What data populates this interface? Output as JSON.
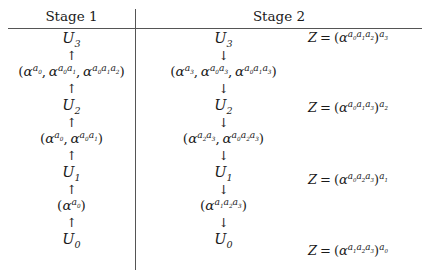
{
  "figure": {
    "type": "two-column-derivation-table",
    "columns": [
      {
        "id": "stage1",
        "header": "Stage 1",
        "arrow_direction": "up",
        "arrow_glyph": "↑"
      },
      {
        "id": "stage2",
        "header": "Stage 2",
        "arrow_direction": "down",
        "arrow_glyph": "↓"
      }
    ]
  },
  "stage1": {
    "header": "Stage 1",
    "arrow": "↑",
    "chain": [
      {
        "kind": "node",
        "text": "U₃",
        "base": "U",
        "subscript": "3"
      },
      {
        "kind": "arrow",
        "text": "↑"
      },
      {
        "kind": "tuple",
        "text": "(α^{a₀}, α^{a₀a₁}, α^{a₀a₁a₂})",
        "terms": [
          {
            "base": "α",
            "exponent": [
              "a0"
            ]
          },
          {
            "base": "α",
            "exponent": [
              "a0",
              "a1"
            ]
          },
          {
            "base": "α",
            "exponent": [
              "a0",
              "a1",
              "a2"
            ]
          }
        ]
      },
      {
        "kind": "arrow",
        "text": "↑"
      },
      {
        "kind": "node",
        "text": "U₂",
        "base": "U",
        "subscript": "2"
      },
      {
        "kind": "arrow",
        "text": "↑"
      },
      {
        "kind": "tuple",
        "text": "(α^{a₀}, α^{a₀a₁})",
        "terms": [
          {
            "base": "α",
            "exponent": [
              "a0"
            ]
          },
          {
            "base": "α",
            "exponent": [
              "a0",
              "a1"
            ]
          }
        ]
      },
      {
        "kind": "arrow",
        "text": "↑"
      },
      {
        "kind": "node",
        "text": "U₁",
        "base": "U",
        "subscript": "1"
      },
      {
        "kind": "arrow",
        "text": "↑"
      },
      {
        "kind": "tuple",
        "text": "(α^{a₀})",
        "terms": [
          {
            "base": "α",
            "exponent": [
              "a0"
            ]
          }
        ]
      },
      {
        "kind": "arrow",
        "text": "↑"
      },
      {
        "kind": "node",
        "text": "U₀",
        "base": "U",
        "subscript": "0"
      }
    ]
  },
  "stage2": {
    "header": "Stage 2",
    "arrow": "↓",
    "chain": [
      {
        "kind": "node",
        "text": "U₃",
        "base": "U",
        "subscript": "3"
      },
      {
        "kind": "arrow",
        "text": "↓"
      },
      {
        "kind": "tuple",
        "text": "(α^{a₃}, α^{a₀a₃}, α^{a₀a₁a₃})",
        "terms": [
          {
            "base": "α",
            "exponent": [
              "a3"
            ]
          },
          {
            "base": "α",
            "exponent": [
              "a0",
              "a3"
            ]
          },
          {
            "base": "α",
            "exponent": [
              "a0",
              "a1",
              "a3"
            ]
          }
        ]
      },
      {
        "kind": "arrow",
        "text": "↓"
      },
      {
        "kind": "node",
        "text": "U₂",
        "base": "U",
        "subscript": "2"
      },
      {
        "kind": "arrow",
        "text": "↓"
      },
      {
        "kind": "tuple",
        "text": "(α^{a₂a₃}, α^{a₀a₂a₃})",
        "terms": [
          {
            "base": "α",
            "exponent": [
              "a2",
              "a3"
            ]
          },
          {
            "base": "α",
            "exponent": [
              "a0",
              "a2",
              "a3"
            ]
          }
        ]
      },
      {
        "kind": "arrow",
        "text": "↓"
      },
      {
        "kind": "node",
        "text": "U₁",
        "base": "U",
        "subscript": "1"
      },
      {
        "kind": "arrow",
        "text": "↓"
      },
      {
        "kind": "tuple",
        "text": "(α^{a₁a₂a₃})",
        "terms": [
          {
            "base": "α",
            "exponent": [
              "a1",
              "a2",
              "a3"
            ]
          }
        ]
      },
      {
        "kind": "arrow",
        "text": "↓"
      },
      {
        "kind": "node",
        "text": "U₀",
        "base": "U",
        "subscript": "0"
      }
    ],
    "equations": [
      {
        "id": "z3",
        "text": "Z = (α^{a₀a₁a₂})^{a₃}",
        "lhs": "Z",
        "relation": "=",
        "inner_base": "α",
        "inner_exponent": [
          "a0",
          "a1",
          "a2"
        ],
        "outer_exponent": "a3",
        "aligned_with": "U3"
      },
      {
        "id": "z2",
        "text": "Z = (α^{a₀a₁a₃})^{a₂}",
        "lhs": "Z",
        "relation": "=",
        "inner_base": "α",
        "inner_exponent": [
          "a0",
          "a1",
          "a3"
        ],
        "outer_exponent": "a2",
        "aligned_with": "U2"
      },
      {
        "id": "z1",
        "text": "Z = (α^{a₀a₂a₃})^{a₁}",
        "lhs": "Z",
        "relation": "=",
        "inner_base": "α",
        "inner_exponent": [
          "a0",
          "a2",
          "a3"
        ],
        "outer_exponent": "a1",
        "aligned_with": "U1"
      },
      {
        "id": "z0",
        "text": "Z = (α^{a₁a₂a₃})^{a₀}",
        "lhs": "Z",
        "relation": "=",
        "inner_base": "α",
        "inner_exponent": [
          "a1",
          "a2",
          "a3"
        ],
        "outer_exponent": "a0",
        "aligned_with": "U0"
      }
    ]
  },
  "colors": {
    "text": "#1a1a1a",
    "rule": "#555555",
    "background": "#ffffff"
  }
}
